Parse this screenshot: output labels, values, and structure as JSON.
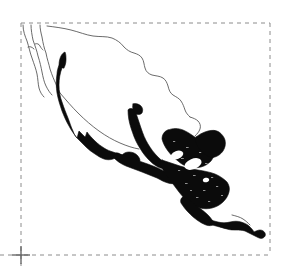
{
  "figure": {
    "description": "Outline map of Mexico and Central America with a solid black shaded distribution band along the Pacific coast and throughout Central America, enclosed by a dashed rectangular frame.",
    "background_color": "#ffffff"
  },
  "frame": {
    "name": "dashed bounding box",
    "stroke_color": "#8c8c8c",
    "stroke_width": 1,
    "dash_pattern": "4 4",
    "left": 21,
    "top": 23,
    "right": 270,
    "bottom": 255,
    "corner_tick": {
      "name": "crosshair tick mark",
      "x": 21,
      "y": 255,
      "arm_length": 9,
      "color": "#6e6e6e"
    },
    "axis_extensions": {
      "bottom_line_extends_left_to_x": 0,
      "left_line_extends_below_to_y": 266
    }
  },
  "map": {
    "coastline": {
      "name": "country outline",
      "stroke_color": "#5a5a5a",
      "stroke_width": 0.9,
      "fill": "none"
    },
    "range_shading": {
      "name": "species distribution shading",
      "fill_color": "#0b0b0b",
      "stroke_color": "#0b0b0b",
      "lake_hole_color": "#ffffff"
    },
    "regions": [
      "Baja California Peninsula",
      "Northern Mexico",
      "Gulf of Mexico coast",
      "Yucatan Peninsula",
      "Pacific coast of Mexico",
      "Guatemala",
      "Honduras",
      "Nicaragua",
      "Costa Rica",
      "Panama"
    ],
    "lakes": [
      "Lake Nicaragua",
      "Lake Managua"
    ]
  }
}
